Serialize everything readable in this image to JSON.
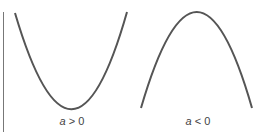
{
  "diagram": {
    "colors": {
      "curve": "#555555",
      "axis": "#777777",
      "text": "#444444"
    },
    "panels": [
      {
        "id": "upward",
        "variable": "a",
        "relation": " > ",
        "value": "0",
        "opens": "up"
      },
      {
        "id": "downward",
        "variable": "a",
        "relation": " < ",
        "value": "0",
        "opens": "down"
      }
    ]
  }
}
